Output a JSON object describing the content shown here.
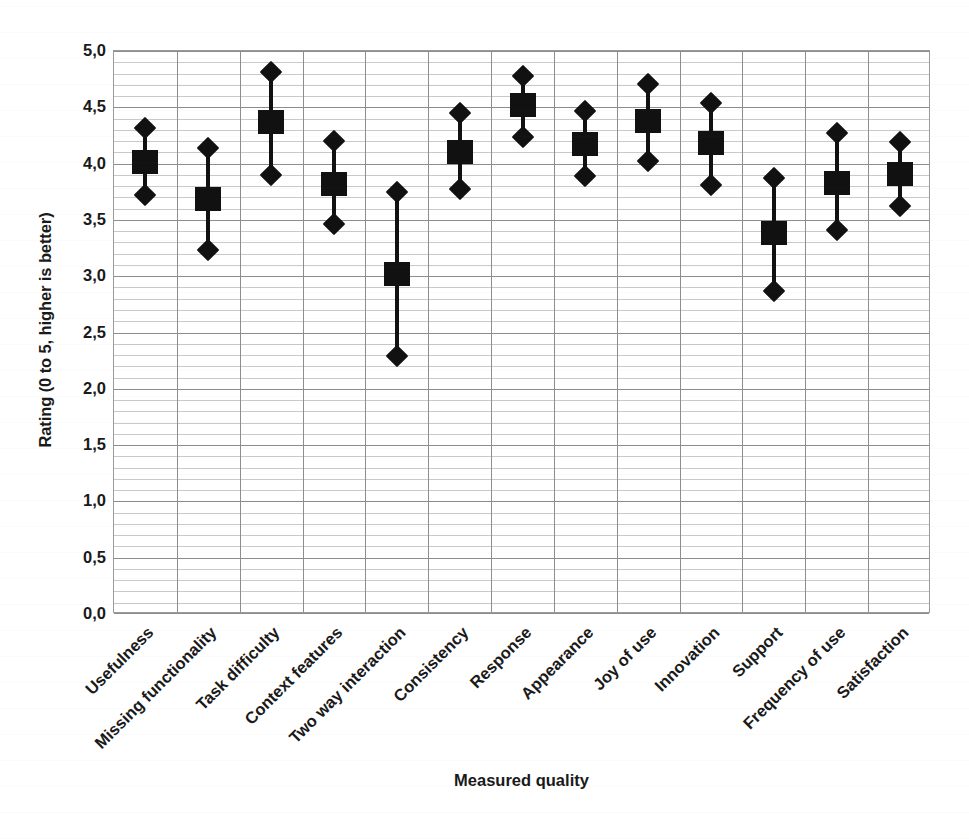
{
  "chart_data": {
    "type": "scatter",
    "title": "",
    "xlabel": "Measured quality",
    "ylabel": "Rating (0 to 5, higher is better)",
    "ylim": [
      0.0,
      5.0
    ],
    "ytick_labels": [
      "5,0",
      "4,5",
      "4,0",
      "3,5",
      "3,0",
      "2,5",
      "2,0",
      "1,5",
      "1,0",
      "0,5",
      "0,0"
    ],
    "ytick_values": [
      5.0,
      4.5,
      4.0,
      3.5,
      3.0,
      2.5,
      2.0,
      1.5,
      1.0,
      0.5,
      0.0
    ],
    "ytick_major_step": 0.5,
    "ytick_minor_step": 0.1,
    "grid": true,
    "grid_vertical": true,
    "legend": "none",
    "marker_mean": "square",
    "marker_bound": "diamond",
    "marker_color": "#111111",
    "categories": [
      "Usefulness",
      "Missing functionality",
      "Task difficulty",
      "Context features",
      "Two way interaction",
      "Consistency",
      "Response",
      "Appearance",
      "Joy of use",
      "Innovation",
      "Support",
      "Frequency of use",
      "Satisfaction"
    ],
    "series": [
      {
        "name": "Mean",
        "values": [
          4.01,
          3.69,
          4.37,
          3.82,
          3.02,
          4.1,
          4.52,
          4.17,
          4.38,
          4.18,
          3.38,
          3.83,
          3.91
        ]
      },
      {
        "name": "Upper bound",
        "values": [
          4.32,
          4.14,
          4.81,
          4.2,
          3.75,
          4.45,
          4.78,
          4.47,
          4.71,
          4.54,
          3.87,
          4.27,
          4.19
        ]
      },
      {
        "name": "Lower bound",
        "values": [
          3.72,
          3.23,
          3.9,
          3.46,
          2.29,
          3.77,
          4.24,
          3.89,
          4.02,
          3.81,
          2.87,
          3.41,
          3.62
        ]
      }
    ]
  },
  "axes": {
    "y_title": "Rating (0 to 5, higher is better)",
    "x_title": "Measured quality"
  },
  "colors": {
    "marker": "#111111",
    "grid_major": "#8d8d8d",
    "grid_minor": "#c9c9c9",
    "plot_border": "#9a9a9a",
    "background": "#ffffff",
    "text": "#1a1a1a"
  }
}
